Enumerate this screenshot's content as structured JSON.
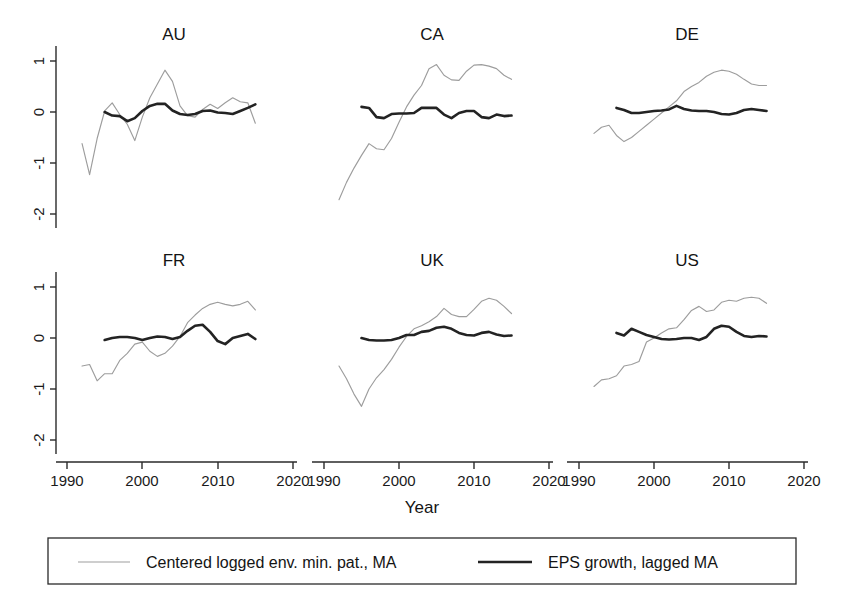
{
  "chart_data": {
    "type": "line",
    "title": "",
    "xlabel": "Year",
    "ylabel": "",
    "xlim": [
      1988,
      2022
    ],
    "ylim": [
      -2.3,
      1.35
    ],
    "xticks": [
      1990,
      2000,
      2010,
      2020
    ],
    "yticks": [
      1,
      0,
      -1,
      -2
    ],
    "xtick_labels": [
      "1990",
      "2000",
      "2010",
      "2020"
    ],
    "ytick_labels": [
      "1",
      "0",
      "-1",
      "-2"
    ],
    "grid": false,
    "legend_position": "bottom",
    "layout": "2 rows x 3 columns of small-multiple panels",
    "series_names": [
      "Centered logged env. min. pat., MA",
      "EPS growth, lagged MA"
    ],
    "series_colors": [
      "#9d9d9d",
      "#232323"
    ],
    "panels": [
      {
        "name": "AU",
        "series": [
          {
            "name": "Centered logged env. min. pat., MA",
            "color": "#9d9d9d",
            "x": [
              1992,
              1993,
              1994,
              1995,
              1996,
              1997,
              1998,
              1999,
              2000,
              2001,
              2002,
              2003,
              2004,
              2005,
              2006,
              2007,
              2008,
              2009,
              2010,
              2011,
              2012,
              2013,
              2014,
              2015
            ],
            "y": [
              -0.62,
              -1.23,
              -0.52,
              0.02,
              0.18,
              -0.05,
              -0.24,
              -0.56,
              -0.1,
              0.28,
              0.55,
              0.82,
              0.6,
              0.12,
              -0.07,
              -0.1,
              0.05,
              0.15,
              0.07,
              0.18,
              0.28,
              0.2,
              0.18,
              -0.22
            ]
          },
          {
            "name": "EPS growth, lagged MA",
            "color": "#232323",
            "x": [
              1995,
              1996,
              1997,
              1998,
              1999,
              2000,
              2001,
              2002,
              2003,
              2004,
              2005,
              2006,
              2007,
              2008,
              2009,
              2010,
              2011,
              2012,
              2013,
              2014,
              2015
            ],
            "y": [
              0.0,
              -0.07,
              -0.08,
              -0.18,
              -0.12,
              0.02,
              0.12,
              0.16,
              0.16,
              0.03,
              -0.04,
              -0.06,
              -0.04,
              0.02,
              0.03,
              -0.01,
              -0.02,
              -0.04,
              0.02,
              0.08,
              0.15
            ]
          }
        ]
      },
      {
        "name": "CA",
        "series": [
          {
            "name": "Centered logged env. min. pat., MA",
            "color": "#9d9d9d",
            "x": [
              1992,
              1993,
              1994,
              1995,
              1996,
              1997,
              1998,
              1999,
              2000,
              2001,
              2002,
              2003,
              2004,
              2005,
              2006,
              2007,
              2008,
              2009,
              2010,
              2011,
              2012,
              2013,
              2014,
              2015
            ],
            "y": [
              -1.72,
              -1.38,
              -1.1,
              -0.85,
              -0.62,
              -0.72,
              -0.74,
              -0.52,
              -0.2,
              0.1,
              0.33,
              0.52,
              0.85,
              0.93,
              0.72,
              0.63,
              0.62,
              0.8,
              0.92,
              0.93,
              0.9,
              0.85,
              0.72,
              0.64
            ]
          },
          {
            "name": "EPS growth, lagged MA",
            "color": "#232323",
            "x": [
              1995,
              1996,
              1997,
              1998,
              1999,
              2000,
              2001,
              2002,
              2003,
              2004,
              2005,
              2006,
              2007,
              2008,
              2009,
              2010,
              2011,
              2012,
              2013,
              2014,
              2015
            ],
            "y": [
              0.1,
              0.08,
              -0.1,
              -0.12,
              -0.04,
              -0.03,
              -0.03,
              -0.02,
              0.08,
              0.08,
              0.08,
              -0.05,
              -0.12,
              -0.02,
              0.02,
              0.02,
              -0.1,
              -0.12,
              -0.05,
              -0.08,
              -0.07
            ]
          }
        ]
      },
      {
        "name": "DE",
        "series": [
          {
            "name": "Centered logged env. min. pat., MA",
            "color": "#9d9d9d",
            "x": [
              1992,
              1993,
              1994,
              1995,
              1996,
              1997,
              1998,
              1999,
              2000,
              2001,
              2002,
              2003,
              2004,
              2005,
              2006,
              2007,
              2008,
              2009,
              2010,
              2011,
              2012,
              2013,
              2014,
              2015
            ],
            "y": [
              -0.42,
              -0.3,
              -0.26,
              -0.46,
              -0.58,
              -0.5,
              -0.38,
              -0.26,
              -0.14,
              -0.02,
              0.1,
              0.22,
              0.4,
              0.5,
              0.58,
              0.7,
              0.78,
              0.82,
              0.8,
              0.74,
              0.64,
              0.55,
              0.52,
              0.52
            ]
          },
          {
            "name": "EPS growth, lagged MA",
            "color": "#232323",
            "x": [
              1995,
              1996,
              1997,
              1998,
              1999,
              2000,
              2001,
              2002,
              2003,
              2004,
              2005,
              2006,
              2007,
              2008,
              2009,
              2010,
              2011,
              2012,
              2013,
              2014,
              2015
            ],
            "y": [
              0.08,
              0.04,
              -0.02,
              -0.02,
              0.0,
              0.02,
              0.03,
              0.05,
              0.12,
              0.06,
              0.03,
              0.02,
              0.02,
              0.0,
              -0.04,
              -0.05,
              -0.02,
              0.04,
              0.06,
              0.04,
              0.02
            ]
          }
        ]
      },
      {
        "name": "FR",
        "series": [
          {
            "name": "Centered logged env. min. pat., MA",
            "color": "#9d9d9d",
            "x": [
              1992,
              1993,
              1994,
              1995,
              1996,
              1997,
              1998,
              1999,
              2000,
              2001,
              2002,
              2003,
              2004,
              2005,
              2006,
              2007,
              2008,
              2009,
              2010,
              2011,
              2012,
              2013,
              2014,
              2015
            ],
            "y": [
              -0.55,
              -0.52,
              -0.84,
              -0.7,
              -0.7,
              -0.44,
              -0.3,
              -0.12,
              -0.08,
              -0.26,
              -0.36,
              -0.3,
              -0.16,
              0.03,
              0.3,
              0.45,
              0.58,
              0.66,
              0.7,
              0.66,
              0.63,
              0.66,
              0.72,
              0.55
            ]
          },
          {
            "name": "EPS growth, lagged MA",
            "color": "#232323",
            "x": [
              1995,
              1996,
              1997,
              1998,
              1999,
              2000,
              2001,
              2002,
              2003,
              2004,
              2005,
              2006,
              2007,
              2008,
              2009,
              2010,
              2011,
              2012,
              2013,
              2014,
              2015
            ],
            "y": [
              -0.04,
              0.0,
              0.02,
              0.02,
              0.0,
              -0.04,
              0.0,
              0.03,
              0.02,
              -0.02,
              0.02,
              0.14,
              0.24,
              0.26,
              0.12,
              -0.06,
              -0.12,
              0.0,
              0.04,
              0.08,
              -0.02
            ]
          }
        ]
      },
      {
        "name": "UK",
        "series": [
          {
            "name": "Centered logged env. min. pat., MA",
            "color": "#9d9d9d",
            "x": [
              1992,
              1993,
              1994,
              1995,
              1996,
              1997,
              1998,
              1999,
              2000,
              2001,
              2002,
              2003,
              2004,
              2005,
              2006,
              2007,
              2008,
              2009,
              2010,
              2011,
              2012,
              2013,
              2014,
              2015
            ],
            "y": [
              -0.55,
              -0.8,
              -1.1,
              -1.34,
              -1.0,
              -0.78,
              -0.62,
              -0.42,
              -0.18,
              0.03,
              0.18,
              0.24,
              0.32,
              0.42,
              0.58,
              0.46,
              0.42,
              0.42,
              0.56,
              0.72,
              0.78,
              0.74,
              0.62,
              0.48
            ]
          },
          {
            "name": "EPS growth, lagged MA",
            "color": "#232323",
            "x": [
              1995,
              1996,
              1997,
              1998,
              1999,
              2000,
              2001,
              2002,
              2003,
              2004,
              2005,
              2006,
              2007,
              2008,
              2009,
              2010,
              2011,
              2012,
              2013,
              2014,
              2015
            ],
            "y": [
              0.0,
              -0.04,
              -0.05,
              -0.05,
              -0.04,
              0.0,
              0.06,
              0.06,
              0.12,
              0.14,
              0.2,
              0.22,
              0.18,
              0.1,
              0.06,
              0.05,
              0.1,
              0.12,
              0.07,
              0.04,
              0.05
            ]
          }
        ]
      },
      {
        "name": "US",
        "series": [
          {
            "name": "Centered logged env. min. pat., MA",
            "color": "#9d9d9d",
            "x": [
              1992,
              1993,
              1994,
              1995,
              1996,
              1997,
              1998,
              1999,
              2000,
              2001,
              2002,
              2003,
              2004,
              2005,
              2006,
              2007,
              2008,
              2009,
              2010,
              2011,
              2012,
              2013,
              2014,
              2015
            ],
            "y": [
              -0.95,
              -0.82,
              -0.8,
              -0.74,
              -0.55,
              -0.52,
              -0.46,
              -0.08,
              0.0,
              0.1,
              0.18,
              0.2,
              0.36,
              0.54,
              0.62,
              0.52,
              0.55,
              0.7,
              0.74,
              0.72,
              0.78,
              0.8,
              0.78,
              0.68
            ]
          },
          {
            "name": "EPS growth, lagged MA",
            "color": "#232323",
            "x": [
              1995,
              1996,
              1997,
              1998,
              1999,
              2000,
              2001,
              2002,
              2003,
              2004,
              2005,
              2006,
              2007,
              2008,
              2009,
              2010,
              2011,
              2012,
              2013,
              2014,
              2015
            ],
            "y": [
              0.1,
              0.05,
              0.18,
              0.12,
              0.06,
              0.02,
              -0.02,
              -0.03,
              -0.02,
              0.0,
              0.0,
              -0.04,
              0.02,
              0.18,
              0.24,
              0.22,
              0.12,
              0.04,
              0.02,
              0.04,
              0.03
            ]
          }
        ]
      }
    ]
  },
  "axis": {
    "x_label": "Year",
    "x_tick_labels": [
      "1990",
      "2000",
      "2010",
      "2020"
    ],
    "y_tick_labels": [
      "1",
      "0",
      "-1",
      "-2"
    ]
  },
  "panel_titles": {
    "au": "AU",
    "ca": "CA",
    "de": "DE",
    "fr": "FR",
    "uk": "UK",
    "us": "US"
  },
  "legend": {
    "entry_1": "Centered logged env. min. pat., MA",
    "entry_2": "EPS growth, lagged MA"
  }
}
